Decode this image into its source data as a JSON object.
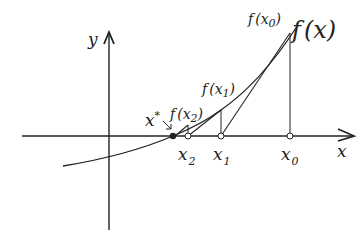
{
  "diagram": {
    "colors": {
      "ink": "#222222",
      "background": "#ffffff"
    },
    "axes": {
      "x_label": "x",
      "y_label": "y"
    },
    "curve": {
      "label": "f(x)",
      "label_parts": {
        "f": "f",
        "arg": "(x)"
      }
    },
    "root": {
      "label": "x",
      "sup": "*"
    },
    "points": [
      {
        "id": "x0",
        "x_label": "x",
        "x_sub": "0",
        "f_label": "f",
        "f_open": "(x",
        "f_close": ")"
      },
      {
        "id": "x1",
        "x_label": "x",
        "x_sub": "1",
        "f_label": "f",
        "f_open": "(x",
        "f_close": ")"
      },
      {
        "id": "x2",
        "x_label": "x",
        "x_sub": "2",
        "f_label": "f",
        "f_open": "(x",
        "f_close": ")"
      }
    ]
  }
}
